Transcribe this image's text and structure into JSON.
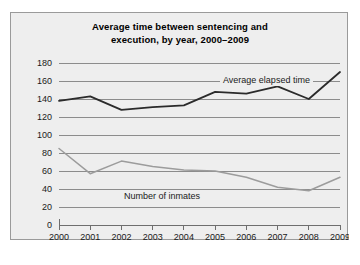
{
  "chart_data": {
    "type": "line",
    "title": "Average time between sentencing and execution, by year, 2000–2009",
    "title_line1": "Average time between sentencing and",
    "title_line2": "execution, by year, 2000–2009",
    "xlabel": "",
    "ylabel": "",
    "ylim": [
      0,
      180
    ],
    "ytick_labels": [
      "180",
      "160",
      "140",
      "120",
      "100",
      "80",
      "60",
      "40",
      "20",
      "0"
    ],
    "ytick_values": [
      180,
      160,
      140,
      120,
      100,
      80,
      60,
      40,
      20,
      0
    ],
    "grid": true,
    "legend_position": "inline-annotations",
    "categories": [
      "2000",
      "2001",
      "2002",
      "2003",
      "2004",
      "2005",
      "2006",
      "2007",
      "2008",
      "2009"
    ],
    "x": [
      2000,
      2001,
      2002,
      2003,
      2004,
      2005,
      2006,
      2007,
      2008,
      2009
    ],
    "series": [
      {
        "name": "Average elapsed time",
        "color": "#2b2b2b",
        "values": [
          138,
          143,
          128,
          131,
          133,
          148,
          146,
          154,
          140,
          170
        ]
      },
      {
        "name": "Number of inmates",
        "color": "#9c9c9c",
        "values": [
          85,
          57,
          71,
          65,
          61,
          60,
          53,
          42,
          38,
          53
        ]
      }
    ],
    "annotations": [
      {
        "text": "Average elapsed time",
        "for_series": "Average elapsed time"
      },
      {
        "text": "Number of inmates",
        "for_series": "Number of inmates"
      }
    ]
  },
  "colors": {
    "figure_background": "#eeeeee",
    "page_background": "#ffffff",
    "border": "#9a9a9a",
    "gridline": "#8c8c8c",
    "axis": "#6e6e6e",
    "dark_series": "#2b2b2b",
    "gray_series": "#9c9c9c",
    "text": "#1a1a1a"
  }
}
